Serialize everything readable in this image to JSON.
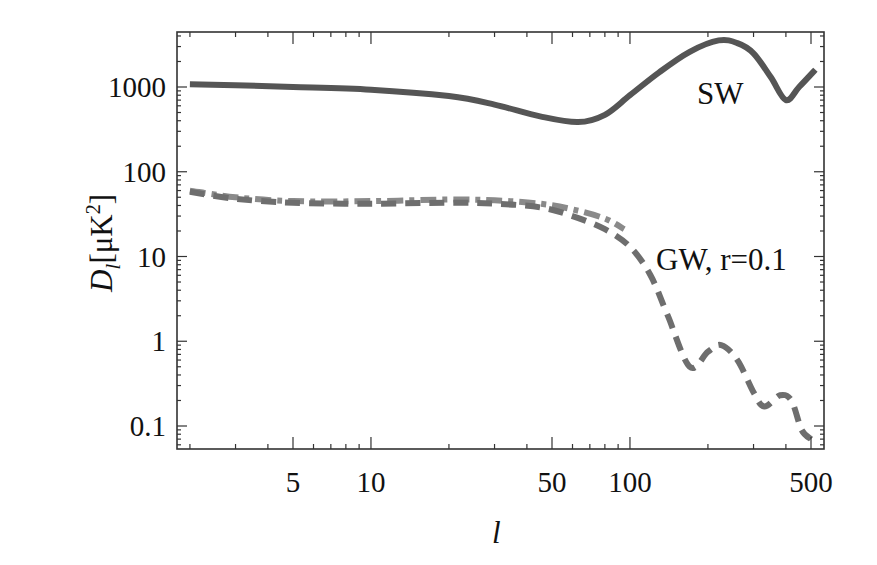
{
  "chart_data": {
    "type": "line",
    "title": "",
    "xlabel": "l",
    "ylabel": "D_l [μK^2]",
    "ylabel_parts": {
      "main": "D",
      "sub": "l",
      "bracket_open": "[",
      "unit": "μK",
      "sup": "2",
      "bracket_close": "]"
    },
    "xscale": "log",
    "yscale": "log",
    "xlim": [
      1.9,
      560
    ],
    "ylim": [
      0.055,
      4300
    ],
    "xticks": [
      5,
      10,
      50,
      100,
      500
    ],
    "xtick_labels": [
      "5",
      "10",
      "50",
      "100",
      "500"
    ],
    "yticks": [
      0.1,
      1,
      10,
      100,
      1000
    ],
    "ytick_labels": [
      "0.1",
      "1",
      "10",
      "100",
      "1000"
    ],
    "grid": false,
    "legend": "inline annotations",
    "annotations": [
      {
        "text": "SW",
        "x": 260,
        "y": 1000
      },
      {
        "text": "GW, r=0.1",
        "x": 250,
        "y": 10
      }
    ],
    "series": [
      {
        "name": "SW",
        "style": "solid",
        "color": "#555555",
        "x": [
          2,
          3,
          5,
          10,
          20,
          30,
          45,
          63,
          80,
          100,
          130,
          170,
          220,
          260,
          300,
          350,
          400,
          450,
          520
        ],
        "values": [
          1080,
          1050,
          1000,
          930,
          780,
          620,
          450,
          385,
          470,
          800,
          1500,
          2600,
          3550,
          3300,
          2500,
          1300,
          700,
          1000,
          1600
        ]
      },
      {
        "name": "GW, r=0.1 (dash-dot)",
        "style": "dashdot",
        "color": "#8a8a8a",
        "x": [
          2,
          3,
          5,
          10,
          20,
          30,
          45,
          60,
          80,
          95
        ],
        "values": [
          60,
          50,
          45,
          45,
          47,
          46,
          42,
          36,
          28,
          21
        ]
      },
      {
        "name": "GW, r=0.1",
        "style": "dashed",
        "color": "#6e6e6e",
        "x": [
          2,
          3,
          5,
          10,
          20,
          30,
          45,
          60,
          80,
          100,
          120,
          140,
          170,
          200,
          225,
          260,
          300,
          330,
          380,
          420,
          460,
          500
        ],
        "values": [
          58,
          48,
          43,
          42,
          43,
          42,
          38,
          30,
          21,
          13,
          6,
          2,
          0.5,
          0.75,
          0.9,
          0.6,
          0.25,
          0.17,
          0.23,
          0.2,
          0.09,
          0.07
        ]
      }
    ]
  }
}
